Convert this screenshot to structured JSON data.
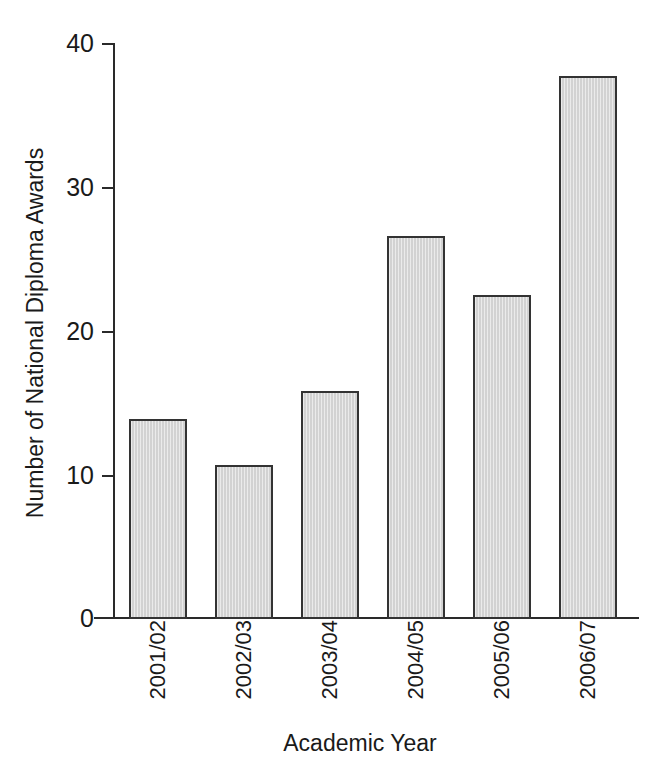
{
  "chart_data": {
    "type": "bar",
    "title": "",
    "subtitle": "",
    "xlabel": "Academic Year",
    "ylabel": "Number of National Diploma Awards",
    "categories": [
      "2001/02",
      "2002/03",
      "2003/04",
      "2004/05",
      "2005/06",
      "2006/07"
    ],
    "values": [
      13.9,
      10.7,
      15.8,
      26.6,
      22.5,
      37.7
    ],
    "series": [
      {
        "name": "National Diploma Awards",
        "values": [
          13.9,
          10.7,
          15.8,
          26.6,
          22.5,
          37.7
        ]
      }
    ],
    "ylim": [
      0,
      40
    ],
    "yticks": [
      0,
      10,
      20,
      30,
      40
    ],
    "ytick_labels": [
      "0",
      "10",
      "20",
      "30",
      "40"
    ],
    "grid": false,
    "legend": false,
    "legend_position": "none",
    "bar_fill_color": "#d2d2d2",
    "bar_edge_color": "#333333",
    "axis_color": "#2a2a2a",
    "background_color": "#ffffff",
    "xtick_label_rotation": 90,
    "annotations": []
  },
  "axes": {
    "y_title": "Number of National Diploma Awards",
    "x_title": "Academic Year"
  }
}
